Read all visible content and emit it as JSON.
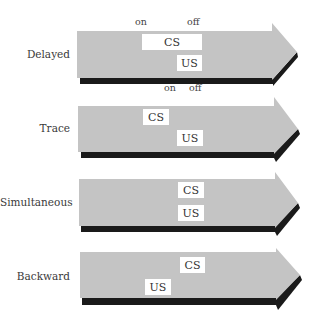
{
  "diagram": {
    "type": "conditioning-timing-diagram",
    "colors": {
      "arrow_fill": "#c4c4c4",
      "arrow_shadow": "#1a1a1a",
      "box_fill": "#ffffff",
      "background": "#ffffff"
    },
    "rows": [
      {
        "label": "Delayed",
        "on_label": "on",
        "off_label": "off",
        "cs": "CS",
        "us": "US"
      },
      {
        "label": "Trace",
        "on_label": "on",
        "off_label": "off",
        "cs": "CS",
        "us": "US"
      },
      {
        "label": "Simultaneous",
        "cs": "CS",
        "us": "US"
      },
      {
        "label": "Backward",
        "cs": "CS",
        "us": "US"
      }
    ]
  }
}
